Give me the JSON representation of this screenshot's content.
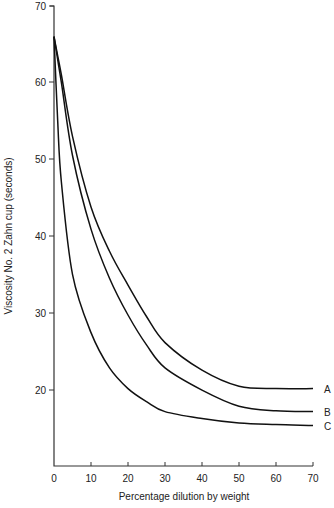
{
  "chart_data": {
    "type": "line",
    "title": "",
    "xlabel": "Percentage dilution by weight",
    "ylabel": "Viscosity No. 2 Zahn cup (seconds)",
    "xlim": [
      0,
      70
    ],
    "ylim": [
      10,
      70
    ],
    "x_ticks": [
      0,
      10,
      20,
      30,
      40,
      50,
      60,
      70
    ],
    "y_ticks": [
      20,
      30,
      40,
      50,
      60,
      70
    ],
    "grid": false,
    "legend_position": "inline-right",
    "x": [
      0,
      1,
      2,
      5,
      10,
      15,
      20,
      25,
      30,
      40,
      50,
      60,
      70
    ],
    "series": [
      {
        "name": "A",
        "values": [
          66,
          63.5,
          61,
          53,
          43.8,
          38,
          33.6,
          29.5,
          26.1,
          22.5,
          20.4,
          20.1,
          20.1
        ]
      },
      {
        "name": "B",
        "values": [
          66,
          63,
          60,
          50.5,
          40.9,
          34.5,
          29.7,
          25.8,
          22.8,
          19.9,
          17.8,
          17.2,
          17.1
        ]
      },
      {
        "name": "C",
        "values": [
          66,
          55,
          47,
          35,
          27.4,
          22.8,
          20.1,
          18.4,
          17.1,
          16.2,
          15.6,
          15.4,
          15.3
        ]
      }
    ]
  },
  "labels": {
    "xlabel": "Percentage dilution by weight",
    "ylabel": "Viscosity No. 2 Zahn cup (seconds)",
    "series_a": "A",
    "series_b": "B",
    "series_c": "C",
    "x_ticks": [
      "0",
      "10",
      "20",
      "30",
      "40",
      "50",
      "60",
      "70"
    ],
    "y_ticks": [
      "20",
      "30",
      "40",
      "50",
      "60",
      "70"
    ]
  }
}
